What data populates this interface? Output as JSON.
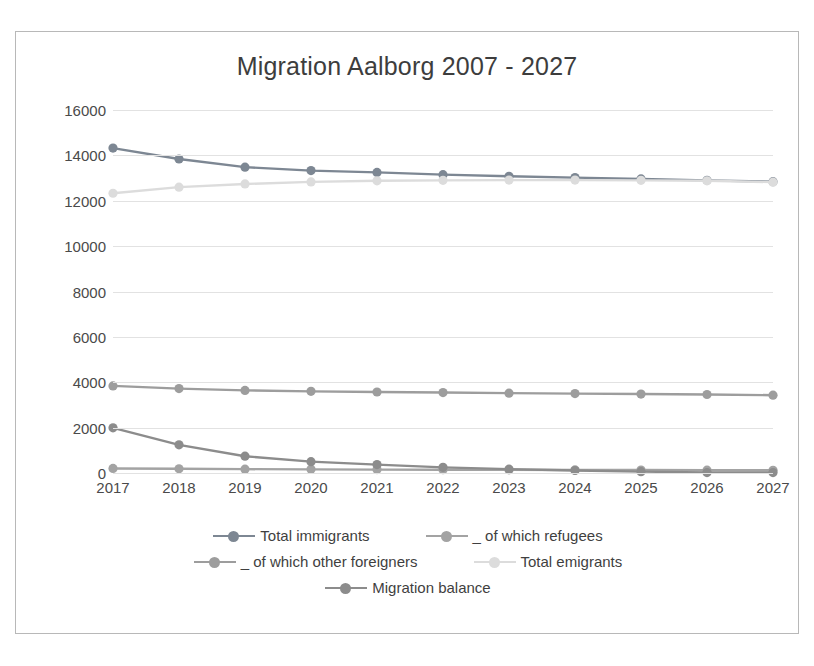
{
  "chart_data": {
    "type": "line",
    "title": "Migration Aalborg 2007 - 2027",
    "xlabel": "",
    "ylabel": "",
    "categories": [
      2017,
      2018,
      2019,
      2020,
      2021,
      2022,
      2023,
      2024,
      2025,
      2026,
      2027
    ],
    "xtick_labels": [
      "2017",
      "2018",
      "2019",
      "2020",
      "2021",
      "2022",
      "2023",
      "2024",
      "2025",
      "2026",
      "2027"
    ],
    "ytick_labels": [
      "0",
      "2000",
      "4000",
      "6000",
      "8000",
      "10000",
      "12000",
      "14000",
      "16000"
    ],
    "ytick_values": [
      0,
      2000,
      4000,
      6000,
      8000,
      10000,
      12000,
      14000,
      16000
    ],
    "ylim": [
      0,
      16000
    ],
    "grid": true,
    "legend_position": "bottom",
    "series": [
      {
        "name": "Total immigrants",
        "color": "#7d8793",
        "values": [
          14320,
          13840,
          13480,
          13330,
          13250,
          13150,
          13080,
          13020,
          12960,
          12900,
          12840
        ]
      },
      {
        "name": "_ of which refugees",
        "color": "#a3a3a3",
        "values": [
          200,
          185,
          170,
          160,
          150,
          145,
          140,
          135,
          130,
          125,
          120
        ]
      },
      {
        "name": "_ of which other foreigners",
        "color": "#9d9d9d",
        "values": [
          3840,
          3720,
          3640,
          3600,
          3570,
          3545,
          3520,
          3500,
          3480,
          3460,
          3430
        ]
      },
      {
        "name": "Total emigrants",
        "color": "#dcdcdc",
        "values": [
          12330,
          12600,
          12740,
          12830,
          12880,
          12900,
          12910,
          12910,
          12900,
          12880,
          12820
        ]
      },
      {
        "name": "Migration balance",
        "color": "#8c8c8c",
        "values": [
          1990,
          1240,
          740,
          500,
          370,
          250,
          170,
          110,
          60,
          20,
          20
        ]
      }
    ]
  },
  "legend": {
    "rows": [
      [
        {
          "label": "Total immigrants",
          "color": "#7d8793"
        },
        {
          "label": "_ of which refugees",
          "color": "#a3a3a3"
        }
      ],
      [
        {
          "label": "_ of which other foreigners",
          "color": "#9d9d9d"
        },
        {
          "label": "Total emigrants",
          "color": "#dcdcdc"
        }
      ],
      [
        {
          "label": "Migration balance",
          "color": "#8c8c8c"
        }
      ]
    ]
  }
}
